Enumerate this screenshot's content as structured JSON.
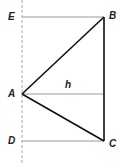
{
  "diagram": {
    "labels": {
      "E": "E",
      "B": "B",
      "A": "A",
      "h": "h",
      "D": "D",
      "C": "C"
    },
    "points": {
      "E": [
        22,
        17
      ],
      "B": [
        104,
        17
      ],
      "A": [
        22,
        94
      ],
      "D": [
        22,
        141
      ],
      "C": [
        104,
        141
      ],
      "foot": [
        104,
        94
      ]
    },
    "colors": {
      "triangle": "#111111",
      "guide": "#999999",
      "dashed": "#aaaaaa",
      "label": "#222222"
    }
  }
}
